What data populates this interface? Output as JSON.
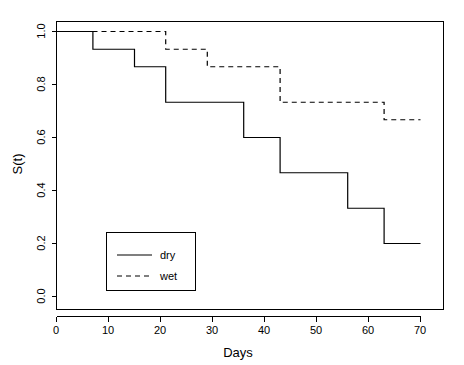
{
  "chart_data": {
    "type": "line",
    "subtype": "kaplan-meier-step",
    "title": "",
    "xlabel": "Days",
    "ylabel": "S(t)",
    "xlim": [
      0,
      73
    ],
    "ylim": [
      0.0,
      1.04
    ],
    "grid": false,
    "xticks": [
      0,
      10,
      20,
      30,
      40,
      50,
      60,
      70
    ],
    "xtick_labels": [
      "0",
      "10",
      "20",
      "30",
      "40",
      "50",
      "60",
      "70"
    ],
    "yticks": [
      0.0,
      0.2,
      0.4,
      0.6,
      0.8,
      1.0
    ],
    "ytick_labels": [
      "0.0",
      "0.2",
      "0.4",
      "0.6",
      "0.8",
      "1.0"
    ],
    "legend_position": "bottom-left",
    "series": [
      {
        "name": "dry",
        "style": "solid",
        "color": "#000000",
        "x": [
          0,
          7,
          7,
          15,
          15,
          21,
          21,
          36,
          36,
          43,
          43,
          56,
          56,
          63,
          63,
          70
        ],
        "y": [
          1.0,
          1.0,
          0.933,
          0.933,
          0.867,
          0.867,
          0.733,
          0.733,
          0.6,
          0.6,
          0.467,
          0.467,
          0.333,
          0.333,
          0.2,
          0.2
        ],
        "step_times": [
          7,
          15,
          21,
          36,
          43,
          56,
          63
        ],
        "step_values": [
          0.933,
          0.867,
          0.733,
          0.6,
          0.467,
          0.333,
          0.2
        ]
      },
      {
        "name": "wet",
        "style": "dashed",
        "color": "#000000",
        "x": [
          0,
          21,
          21,
          29,
          29,
          43,
          43,
          63,
          63,
          70
        ],
        "y": [
          1.0,
          1.0,
          0.933,
          0.933,
          0.867,
          0.867,
          0.733,
          0.733,
          0.667,
          0.667
        ],
        "step_times": [
          21,
          29,
          43,
          63
        ],
        "step_values": [
          0.933,
          0.867,
          0.733,
          0.667
        ]
      }
    ]
  },
  "legend": {
    "entries": [
      {
        "label": "dry",
        "style": "solid"
      },
      {
        "label": "wet",
        "style": "dashed"
      }
    ]
  },
  "axes": {
    "x_title": "Days",
    "y_title": "S(t)"
  }
}
